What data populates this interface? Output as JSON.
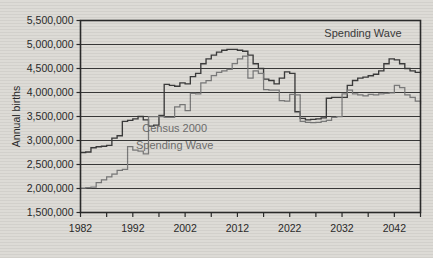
{
  "chart_data": {
    "type": "line",
    "title": "",
    "xlabel": "",
    "ylabel": "Annual births",
    "xlim": [
      1982,
      2047
    ],
    "ylim": [
      1500000,
      5500000
    ],
    "grid": true,
    "legend_position": "inline-annotation",
    "ytick_labels": [
      "5,500,000",
      "5,000,000",
      "4,500,000",
      "4,000,000",
      "3,500,000",
      "3,000,000",
      "2,500,000",
      "2,000,000",
      "1,500,000"
    ],
    "ytick_values": [
      5500000,
      5000000,
      4500000,
      4000000,
      3500000,
      3000000,
      2500000,
      2000000,
      1500000
    ],
    "xtick_labels": [
      "1982",
      "1992",
      "2002",
      "2012",
      "2022",
      "2032",
      "2042"
    ],
    "xtick_values": [
      1982,
      1992,
      2002,
      2012,
      2022,
      2032,
      2042
    ],
    "xtick_minor_step": 5,
    "annotations": [
      {
        "name": "spending-wave-top",
        "text": "Spending Wave",
        "x": 2036,
        "y": 5150000,
        "color": "#3a3a3a"
      },
      {
        "name": "census-2000-legend",
        "text": "Census 2000",
        "x": 2000,
        "y": 3180000,
        "color": "#6d6d6d"
      },
      {
        "name": "spending-wave-legend",
        "text": "Spending Wave",
        "x": 2000,
        "y": 2830000,
        "color": "#6d6d6d"
      }
    ],
    "x": [
      1982,
      1983,
      1984,
      1985,
      1986,
      1987,
      1988,
      1989,
      1990,
      1991,
      1992,
      1993,
      1994,
      1995,
      1996,
      1997,
      1998,
      1999,
      2000,
      2001,
      2002,
      2003,
      2004,
      2005,
      2006,
      2007,
      2008,
      2009,
      2010,
      2011,
      2012,
      2013,
      2014,
      2015,
      2016,
      2017,
      2018,
      2019,
      2020,
      2021,
      2022,
      2023,
      2024,
      2025,
      2026,
      2027,
      2028,
      2029,
      2030,
      2031,
      2032,
      2033,
      2034,
      2035,
      2036,
      2037,
      2038,
      2039,
      2040,
      2041,
      2042,
      2043,
      2044,
      2045,
      2046,
      2047
    ],
    "series": [
      {
        "name": "Spending Wave",
        "color": "#3b3b3b",
        "style": "step",
        "values": [
          2750000,
          2760000,
          2850000,
          2870000,
          2880000,
          2900000,
          3050000,
          3100000,
          3400000,
          3420000,
          3450000,
          3500000,
          3430000,
          3300000,
          3320000,
          3520000,
          4170000,
          4150000,
          4130000,
          4200000,
          4180000,
          4330000,
          4400000,
          4600000,
          4700000,
          4780000,
          4840000,
          4880000,
          4900000,
          4900000,
          4880000,
          4860000,
          4780000,
          4600000,
          4500000,
          4280000,
          4250000,
          4180000,
          4300000,
          4430000,
          4400000,
          3600000,
          3460000,
          3430000,
          3440000,
          3450000,
          3470000,
          3880000,
          3900000,
          3900000,
          3900000,
          4150000,
          4250000,
          4300000,
          4320000,
          4350000,
          4380000,
          4450000,
          4600000,
          4700000,
          4680000,
          4600000,
          4500000,
          4450000,
          4420000,
          4400000
        ]
      },
      {
        "name": "Census 2000",
        "color": "#7a7a7a",
        "style": "step",
        "values": [
          2010000,
          2020000,
          2030000,
          2120000,
          2180000,
          2240000,
          2300000,
          2380000,
          2400000,
          2870000,
          2800000,
          2780000,
          2720000,
          3500000,
          3500000,
          3500000,
          3480000,
          3480000,
          3700000,
          3750000,
          3620000,
          3980000,
          3970000,
          4200000,
          4250000,
          4350000,
          4420000,
          4450000,
          4480000,
          4600000,
          4700000,
          4760000,
          4300000,
          4450000,
          4400000,
          4060000,
          4050000,
          4050000,
          3830000,
          3820000,
          3960000,
          3950000,
          3400000,
          3380000,
          3370000,
          3380000,
          3400000,
          3420000,
          3480000,
          3500000,
          3970000,
          4050000,
          3970000,
          3950000,
          3930000,
          3960000,
          3950000,
          3970000,
          3980000,
          3990000,
          4150000,
          4100000,
          3950000,
          3900000,
          3820000,
          3760000
        ]
      }
    ]
  }
}
